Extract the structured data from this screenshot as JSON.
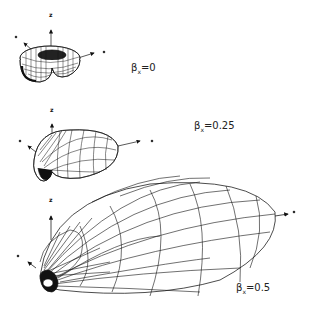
{
  "figure": {
    "panels": [
      {
        "beta_symbol": "β",
        "beta_sub": "x",
        "beta_text": "=0",
        "z_axis": "z"
      },
      {
        "beta_symbol": "β",
        "beta_sub": "x",
        "beta_text": "=0.25",
        "z_axis": "z"
      },
      {
        "beta_symbol": "β",
        "beta_sub": "x",
        "beta_text": "=0.5",
        "z_axis": "z"
      }
    ],
    "colors": {
      "line": "#111111",
      "background": "#ffffff"
    }
  }
}
